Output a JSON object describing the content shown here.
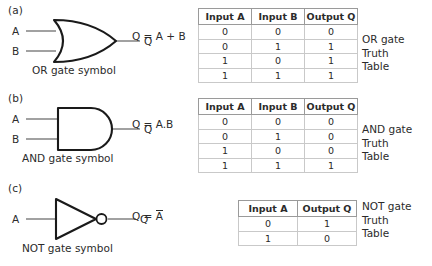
{
  "figure": {
    "sections": [
      {
        "id": "a",
        "label": "(a)",
        "gate": "or-gate",
        "inputs": [
          "A",
          "B"
        ],
        "output": "Q",
        "caption": "OR gate symbol",
        "equation": "Q = A + B",
        "table_caption_lines": [
          "OR gate",
          "Truth",
          "Table"
        ],
        "table": {
          "headers": [
            "Input A",
            "Input B",
            "Output Q"
          ],
          "rows": [
            [
              "0",
              "0",
              "0"
            ],
            [
              "0",
              "1",
              "1"
            ],
            [
              "1",
              "0",
              "1"
            ],
            [
              "1",
              "1",
              "1"
            ]
          ]
        }
      },
      {
        "id": "b",
        "label": "(b)",
        "gate": "and-gate",
        "inputs": [
          "A",
          "B"
        ],
        "output": "Q",
        "caption": "AND gate symbol",
        "equation": "Q = A.B",
        "table_caption_lines": [
          "AND gate",
          "Truth",
          "Table"
        ],
        "table": {
          "headers": [
            "Input A",
            "Input B",
            "Output Q"
          ],
          "rows": [
            [
              "0",
              "0",
              "0"
            ],
            [
              "0",
              "1",
              "0"
            ],
            [
              "1",
              "0",
              "0"
            ],
            [
              "1",
              "1",
              "1"
            ]
          ]
        }
      },
      {
        "id": "c",
        "label": "(c)",
        "gate": "not-gate",
        "inputs": [
          "A"
        ],
        "output": "Q",
        "caption": "NOT gate symbol",
        "equation_prefix": "Q = ",
        "equation_overbar": "A",
        "table_caption_lines": [
          "NOT gate",
          "Truth",
          "Table"
        ],
        "table": {
          "headers": [
            "Input A",
            "Output Q"
          ],
          "rows": [
            [
              "0",
              "1"
            ],
            [
              "1",
              "0"
            ]
          ]
        }
      }
    ],
    "colors": {
      "ink": "#2b2b2b",
      "wire": "#8a8a8a",
      "gate_stroke": "#1a1a1a",
      "table_border": "#c9c9c9",
      "background": "#ffffff"
    }
  }
}
